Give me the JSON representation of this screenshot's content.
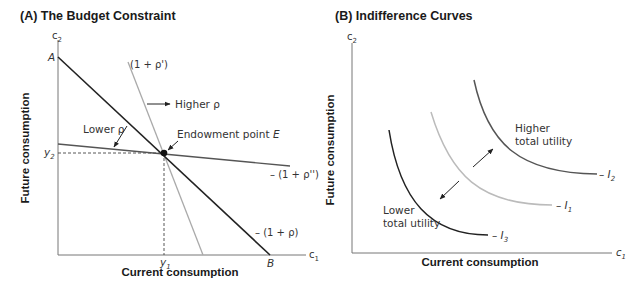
{
  "panel_a": {
    "title": "(A) The Budget Constraint",
    "y_axis_symbol": "c",
    "y_axis_sub": "2",
    "x_axis_symbol": "c",
    "x_axis_sub": "1",
    "y_axis_title": "Future consumption",
    "x_axis_title": "Current consumption",
    "point_a": "A",
    "point_b": "B",
    "y2_label": "y",
    "y2_sub": "2",
    "y1_label": "y",
    "y1_sub": "1",
    "endowment_label": "Endowment point ",
    "endowment_point": "E",
    "higher_rho": "Higher ρ",
    "lower_rho": "Lower ρ",
    "line_main_label": "– (1 + ρ)",
    "line_steep_label": "(1 + ρ')",
    "line_flat_label": "– (1 + ρ'')",
    "colors": {
      "main_line": "#222222",
      "steep_line": "#aaaaaa",
      "flat_line": "#555555",
      "axis": "#777777"
    }
  },
  "panel_b": {
    "title": "(B) Indifference Curves",
    "y_axis_symbol": "c",
    "y_axis_sub": "2",
    "x_axis_symbol": "c",
    "x_axis_sub": "1",
    "y_axis_title": "Future consumption",
    "x_axis_title": "Current consumption",
    "higher_utility_line1": "Higher",
    "higher_utility_line2": "total utility",
    "lower_utility_line1": "Lower",
    "lower_utility_line2": "total utility",
    "curves": [
      {
        "name": "I",
        "sub": "3",
        "color": "#222222"
      },
      {
        "name": "I",
        "sub": "1",
        "color": "#bbbbbb"
      },
      {
        "name": "I",
        "sub": "2",
        "color": "#555555"
      }
    ]
  }
}
